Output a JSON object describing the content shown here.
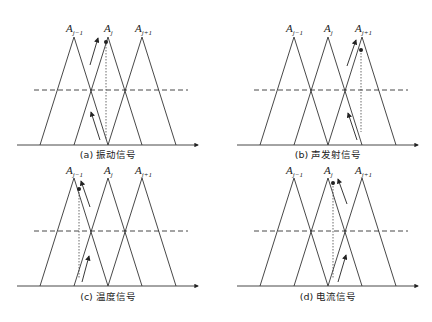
{
  "figure": {
    "panels": [
      {
        "id": "a",
        "caption": "(a) 振动信号",
        "active_set": 1,
        "labels": [
          "A",
          "A",
          "A"
        ],
        "subs": [
          "j−1",
          "j",
          "j+1"
        ]
      },
      {
        "id": "b",
        "caption": "(b) 声发射信号",
        "active_set": 2,
        "labels": [
          "A",
          "A",
          "A"
        ],
        "subs": [
          "j−1",
          "j",
          "j+1"
        ]
      },
      {
        "id": "c",
        "caption": "(c) 温度信号",
        "active_set": 0,
        "labels": [
          "A",
          "A",
          "A"
        ],
        "subs": [
          "j−1",
          "j",
          "j+1"
        ]
      },
      {
        "id": "d",
        "caption": "(d) 电流信号",
        "active_set": 1,
        "labels": [
          "A",
          "A",
          "A"
        ],
        "subs": [
          "j−1",
          "j",
          "j+1"
        ]
      }
    ],
    "colors": {
      "line": "#333333",
      "background": "#ffffff"
    }
  }
}
